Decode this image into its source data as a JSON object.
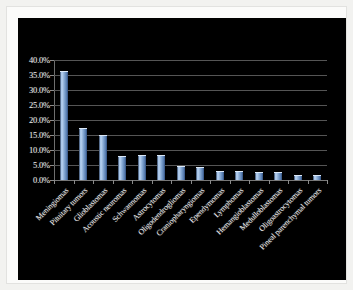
{
  "chart_data": {
    "type": "bar",
    "title": "",
    "subtitle": "",
    "xlabel": "",
    "ylabel": "",
    "ylim": [
      0,
      40
    ],
    "grid": true,
    "legend": null,
    "y_tick_labels": [
      "40.0%",
      "35.0%",
      "30.0%",
      "25.0%",
      "20.0%",
      "15.0%",
      "10.0%",
      "5.0%",
      "0.0%"
    ],
    "y_tick_values": [
      40,
      35,
      30,
      25,
      20,
      15,
      10,
      5,
      0
    ],
    "categories": [
      "Meningiomas",
      "Pituitary tumors",
      "Glioblastomas",
      "Acoustic neuromas",
      "Schwannomas",
      "Astrocytomas",
      "Oligodendrogliomas",
      "Craniopharyngiomas",
      "Ependymomas",
      "Lymphomas",
      "Hemangioblastomas",
      "Medulloblastomas",
      "Oligoastrocytomas",
      "Pineal parenchymal tumors"
    ],
    "values": [
      36.0,
      17.0,
      14.8,
      7.8,
      8.0,
      8.0,
      4.3,
      3.9,
      2.7,
      2.7,
      2.3,
      2.3,
      1.2,
      1.2
    ],
    "value_unit": "%",
    "colors": {
      "panel_background": "#000000",
      "page_background": "#f2f2f0",
      "bar_highlight": "#b9d2f0",
      "bar_mid": "#7fa3cf",
      "bar_dark": "#2d4874",
      "gridline": "#555555",
      "axis_line": "#6e6e6e",
      "label_text": "#ececec"
    }
  }
}
